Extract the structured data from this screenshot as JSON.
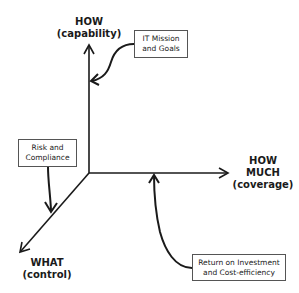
{
  "diagram": {
    "axes": {
      "vertical": {
        "title": "HOW",
        "subtitle": "(capability)"
      },
      "horizontal": {
        "title_line1": "HOW",
        "title_line2": "MUCH",
        "subtitle": "(coverage)"
      },
      "diagonal": {
        "title": "WHAT",
        "subtitle": "(control)"
      }
    },
    "boxes": {
      "it_mission": {
        "line1": "IT Mission",
        "line2": "and Goals"
      },
      "risk": {
        "line1": "Risk and",
        "line2": "Compliance"
      },
      "roi": {
        "line1": "Return on Investment",
        "line2": "and Cost-efficiency"
      }
    },
    "colors": {
      "line": "#1a1a1a",
      "box_border": "#555555",
      "background": "#ffffff"
    }
  }
}
